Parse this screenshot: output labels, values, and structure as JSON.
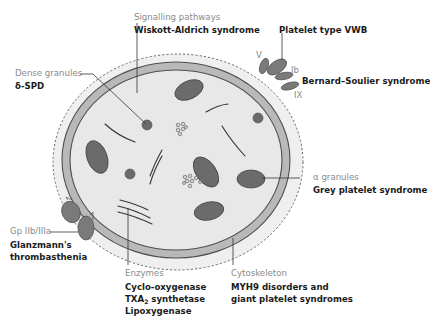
{
  "colors": {
    "background": "#ffffff",
    "cytoplasm": "#e8e8e8",
    "outer_glycocalyx": "#efefef",
    "membrane_ring": "#b7b7b7",
    "membrane_edge": "#5a5a5a",
    "granule_fill": "#6b6b6b",
    "label_category": "#8a8a8a",
    "label_disease": "#1a1a1a",
    "leader_line": "#333333"
  },
  "labels": {
    "signalling": {
      "category": "Signalling pathways",
      "disease": "Wiskott-Aldrich syndrome"
    },
    "dense": {
      "category": "Dense granules",
      "disease": "δ-SPD"
    },
    "vwb": {
      "disease": "Platelet type VWB"
    },
    "gpib": {
      "v": "V",
      "ib": "Ib",
      "ix": "IX",
      "disease": "Bernard–Soulier syndrome"
    },
    "alpha": {
      "category": "α granules",
      "disease": "Grey platelet syndrome"
    },
    "gpiib": {
      "category": "Gp IIb/IIIa",
      "disease_line1": "Glanzmann's",
      "disease_line2": "thrombasthenia"
    },
    "enzymes": {
      "category": "Enzymes",
      "item1": "Cyclo-oxygenase",
      "item2_main": "TXA",
      "item2_sub": "2",
      "item2_rest": " synthetase",
      "item3": "Lipoxygenase"
    },
    "cytoskeleton": {
      "category": "Cytoskeleton",
      "disease_line1": "MYH9 disorders and",
      "disease_line2": "giant platelet syndromes"
    }
  }
}
